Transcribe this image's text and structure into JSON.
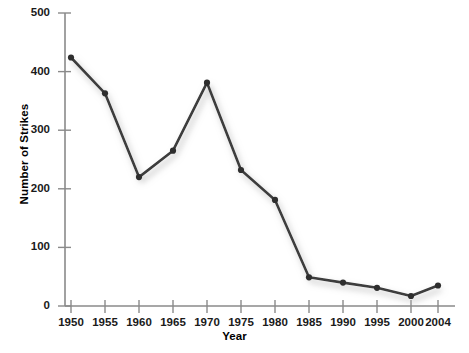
{
  "chart_data": {
    "type": "line",
    "title": "",
    "xlabel": "Year",
    "ylabel": "Number of Strikes",
    "categories": [
      "1950",
      "1955",
      "1960",
      "1965",
      "1970",
      "1975",
      "1980",
      "1985",
      "1990",
      "1995",
      "2000",
      "2004"
    ],
    "x": [
      1950,
      1955,
      1960,
      1965,
      1970,
      1975,
      1980,
      1985,
      1990,
      1995,
      2000,
      2004
    ],
    "values": [
      424,
      363,
      220,
      265,
      381,
      232,
      181,
      49,
      40,
      31,
      17,
      35
    ],
    "series": [
      {
        "name": "Number of Strikes",
        "values": [
          424,
          363,
          220,
          265,
          381,
          232,
          181,
          49,
          40,
          31,
          17,
          35
        ]
      }
    ],
    "ylim": [
      0,
      500
    ],
    "yticks": [
      0,
      100,
      200,
      300,
      400,
      500
    ],
    "ytick_labels": [
      "0",
      "100",
      "200",
      "300",
      "400",
      "500"
    ],
    "xtick_labels": [
      "1950",
      "1955",
      "1960",
      "1965",
      "1970",
      "1975",
      "1980",
      "1985",
      "1990",
      "1995",
      "2000",
      "2004"
    ],
    "grid": false,
    "legend": "none",
    "line_color": "#3c3c3c",
    "marker_color": "#2e2e2e",
    "shadow_color": "#c9c9c9",
    "axis_color": "#8a8a8a"
  },
  "axis": {
    "y_title": "Number of Strikes",
    "x_title": "Year",
    "y_labels": [
      "500",
      "400",
      "300",
      "200",
      "100",
      "0"
    ],
    "x_labels": [
      "1950",
      "1955",
      "1960",
      "1965",
      "1970",
      "1975",
      "1980",
      "1985",
      "1990",
      "1995",
      "2000",
      "2004"
    ]
  }
}
